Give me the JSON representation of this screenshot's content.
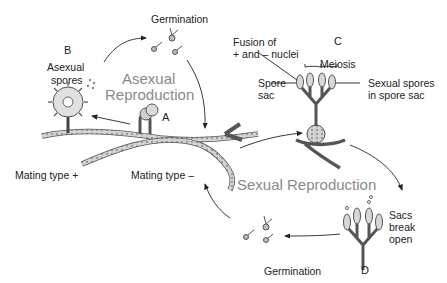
{
  "diagram": {
    "type": "life-cycle",
    "sections": {
      "asexual_title_line1": "Asexual",
      "asexual_title_line2": "Reproduction",
      "sexual_title": "Sexual Reproduction"
    },
    "stages": {
      "A": "A",
      "B": "B",
      "C": "C",
      "D": "D"
    },
    "labels": {
      "germination_top": "Germination",
      "germination_bottom": "Germination",
      "asexual_spores_line1": "Asexual",
      "asexual_spores_line2": "spores",
      "fusion_line1": "Fusion of",
      "fusion_line2": "+ and – nuclei",
      "meiosis": "Meiosis",
      "spore_sac_line1": "Spore",
      "spore_sac_line2": "sac",
      "sexual_spores_line1": "Sexual spores",
      "sexual_spores_line2": "in spore sac",
      "mating_plus": "Mating type +",
      "mating_minus": "Mating type –",
      "sacs_line1": "Sacs",
      "sacs_line2": "break",
      "sacs_line3": "open"
    },
    "colors": {
      "line": "#333333",
      "hypha_fill": "#cfcfcf",
      "section_title": "#8a8a8a",
      "text": "#222222"
    }
  }
}
